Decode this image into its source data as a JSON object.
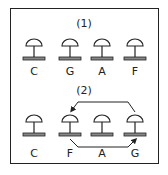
{
  "panel1": {
    "title": "(1)",
    "labels": [
      "C",
      "G",
      "A",
      "F"
    ]
  },
  "panel2": {
    "title": "(2)",
    "labels": [
      "C",
      "F",
      "A",
      "G"
    ],
    "arrows": [
      {
        "from": "G",
        "to": "F",
        "path": "top"
      },
      {
        "from": "F",
        "to": "G",
        "path": "bottom"
      }
    ]
  },
  "colors": {
    "stroke": "#222222",
    "base_fill": "#888888"
  }
}
